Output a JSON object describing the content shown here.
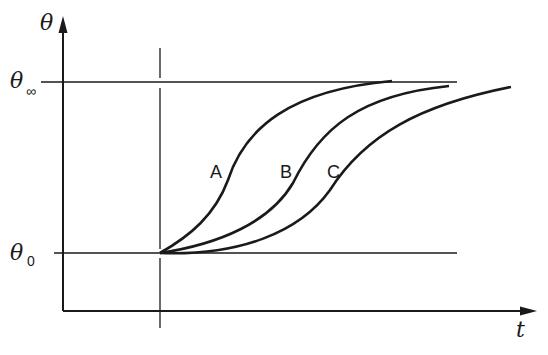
{
  "diagram": {
    "y_axis_label": "θ",
    "x_axis_label": "t",
    "theta_inf_label": "θ",
    "theta_inf_sub": "∞",
    "theta_0_label": "θ",
    "theta_0_sub": "0",
    "curves": [
      {
        "name": "A"
      },
      {
        "name": "B"
      },
      {
        "name": "C"
      }
    ],
    "colors": {
      "stroke": "#1a1a1a",
      "background": "#ffffff"
    }
  }
}
